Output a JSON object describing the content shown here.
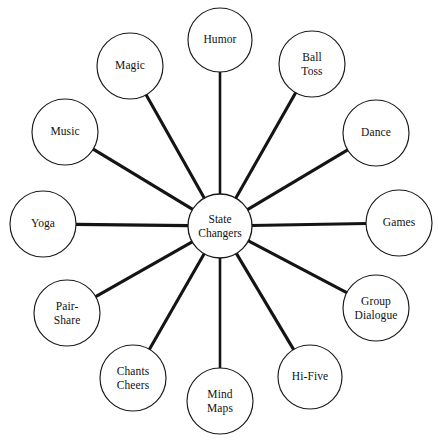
{
  "diagram": {
    "type": "hub-and-spoke radial map",
    "title_visible": false,
    "background_color": "#ffffff",
    "stroke_color": "#141414",
    "text_color": "#111111",
    "hub": {
      "label": "State\nChangers",
      "label_flat": "State Changers",
      "cx": 220,
      "cy": 226,
      "r": 32
    },
    "nodes": [
      {
        "label": "Humor",
        "label_flat": "Humor",
        "cx": 220,
        "cy": 40,
        "r": 32,
        "angle_deg": 270
      },
      {
        "label": "Ball\nToss",
        "label_flat": "Ball Toss",
        "cx": 312,
        "cy": 64,
        "r": 33,
        "angle_deg": 300
      },
      {
        "label": "Dance",
        "label_flat": "Dance",
        "cx": 376,
        "cy": 133,
        "r": 33,
        "angle_deg": 330
      },
      {
        "label": "Games",
        "label_flat": "Games",
        "cx": 399,
        "cy": 223,
        "r": 33,
        "angle_deg": 0
      },
      {
        "label": "Group\nDialogue",
        "label_flat": "Group Dialogue",
        "cx": 376,
        "cy": 308,
        "r": 33,
        "angle_deg": 30
      },
      {
        "label": "Hi-Five",
        "label_flat": "Hi-Five",
        "cx": 310,
        "cy": 377,
        "r": 32,
        "angle_deg": 60
      },
      {
        "label": "Mind\nMaps",
        "label_flat": "Mind Maps",
        "cx": 220,
        "cy": 401,
        "r": 33,
        "angle_deg": 90
      },
      {
        "label": "Chants\nCheers",
        "label_flat": "Chants Cheers",
        "cx": 133,
        "cy": 378,
        "r": 33,
        "angle_deg": 120
      },
      {
        "label": "Pair-\nShare",
        "label_flat": "Pair-Share",
        "cx": 67,
        "cy": 313,
        "r": 33,
        "angle_deg": 150
      },
      {
        "label": "Yoga",
        "label_flat": "Yoga",
        "cx": 43,
        "cy": 224,
        "r": 33,
        "angle_deg": 180
      },
      {
        "label": "Music",
        "label_flat": "Music",
        "cx": 65,
        "cy": 132,
        "r": 33,
        "angle_deg": 210
      },
      {
        "label": "Magic",
        "label_flat": "Magic",
        "cx": 130,
        "cy": 66,
        "r": 33,
        "angle_deg": 240
      }
    ]
  }
}
